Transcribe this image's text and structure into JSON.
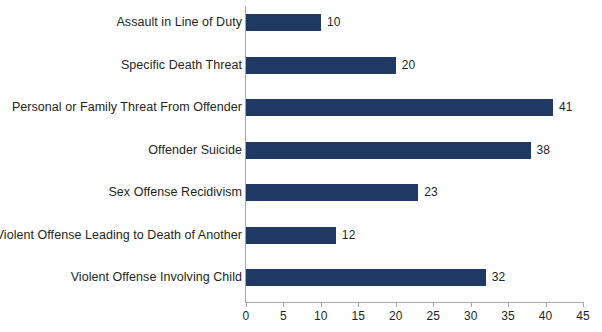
{
  "chart_data": {
    "type": "bar",
    "orientation": "horizontal",
    "title": "",
    "subtitle": "",
    "xlabel": "",
    "ylabel": "",
    "xlim": [
      0,
      45
    ],
    "xticks": [
      0,
      5,
      10,
      15,
      20,
      25,
      30,
      35,
      40,
      45
    ],
    "tick_labels": [
      "0",
      "5",
      "10",
      "15",
      "20",
      "25",
      "30",
      "35",
      "40",
      "45"
    ],
    "grid": false,
    "legend": false,
    "legend_position": "none",
    "data_labels": true,
    "categories": [
      "Assault in Line of Duty",
      "Specific Death Threat",
      "Personal or Family Threat From Offender",
      "Offender Suicide",
      "Sex Offense Recidivism",
      "Violent Offense Leading to Death of Another",
      "Violent Offense Involving Child"
    ],
    "values": [
      10,
      20,
      41,
      38,
      23,
      12,
      32
    ],
    "value_labels": [
      "10",
      "20",
      "41",
      "38",
      "23",
      "12",
      "32"
    ],
    "series": [
      {
        "name": "Count",
        "values": [
          10,
          20,
          41,
          38,
          23,
          12,
          32
        ]
      }
    ]
  },
  "colors": {
    "bar": "#1f3864",
    "axis": "#a6a6a6",
    "text": "#231f20",
    "background": "#ffffff"
  }
}
